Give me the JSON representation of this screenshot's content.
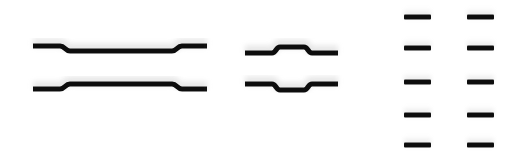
{
  "scene": {
    "description": "Photograph of black dog-bone shaped test specimens on white background",
    "background_color": "#ffffff",
    "specimen_color": "#111111",
    "shadow_color": "#d8d8d8"
  },
  "specimens": {
    "large": [
      {
        "label": "large-specimen-1",
        "x1": 33,
        "x2": 207,
        "end_y": 46,
        "center_y": 51,
        "neck_start": 60,
        "neck_end": 182
      },
      {
        "label": "large-specimen-2",
        "x1": 33,
        "x2": 207,
        "end_y": 89,
        "center_y": 84,
        "neck_start": 60,
        "neck_end": 182
      }
    ],
    "medium": [
      {
        "label": "medium-specimen-1",
        "x1": 245,
        "x2": 338,
        "end_y": 53,
        "center_y": 47,
        "neck_start": 272,
        "neck_end": 312
      },
      {
        "label": "medium-specimen-2",
        "x1": 245,
        "x2": 338,
        "end_y": 84,
        "center_y": 90,
        "neck_start": 272,
        "neck_end": 312
      }
    ],
    "small": [
      {
        "label": "small-specimen-1",
        "x": 404,
        "y": 17,
        "w": 27
      },
      {
        "label": "small-specimen-2",
        "x": 467,
        "y": 17,
        "w": 27
      },
      {
        "label": "small-specimen-3",
        "x": 404,
        "y": 48,
        "w": 27
      },
      {
        "label": "small-specimen-4",
        "x": 467,
        "y": 48,
        "w": 27
      },
      {
        "label": "small-specimen-5",
        "x": 404,
        "y": 82,
        "w": 27
      },
      {
        "label": "small-specimen-6",
        "x": 467,
        "y": 82,
        "w": 27
      },
      {
        "label": "small-specimen-7",
        "x": 404,
        "y": 115,
        "w": 27
      },
      {
        "label": "small-specimen-8",
        "x": 467,
        "y": 115,
        "w": 27
      },
      {
        "label": "small-specimen-9",
        "x": 404,
        "y": 145,
        "w": 27
      },
      {
        "label": "small-specimen-10",
        "x": 467,
        "y": 145,
        "w": 27
      }
    ]
  }
}
